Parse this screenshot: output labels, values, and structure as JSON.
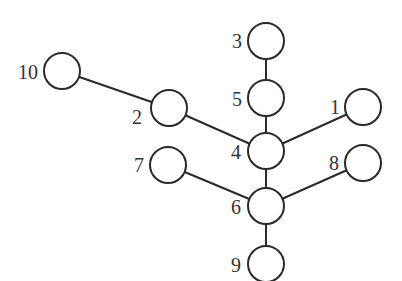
{
  "diagram": {
    "type": "tree",
    "node_radius": 18,
    "colors": {
      "stroke": "#2a2a2a",
      "fill": "#ffffff",
      "label": "#333333"
    },
    "nodes": [
      {
        "id": "1",
        "label": "1",
        "cx": 363,
        "cy": 107,
        "lx": 330,
        "ly": 114,
        "anchor": "start"
      },
      {
        "id": "2",
        "label": "2",
        "cx": 169,
        "cy": 108,
        "lx": 132,
        "ly": 124,
        "anchor": "start"
      },
      {
        "id": "3",
        "label": "3",
        "cx": 266,
        "cy": 41,
        "lx": 232,
        "ly": 48,
        "anchor": "start"
      },
      {
        "id": "4",
        "label": "4",
        "cx": 266,
        "cy": 151,
        "lx": 231,
        "ly": 159,
        "anchor": "start"
      },
      {
        "id": "5",
        "label": "5",
        "cx": 266,
        "cy": 98,
        "lx": 232,
        "ly": 106,
        "anchor": "start"
      },
      {
        "id": "6",
        "label": "6",
        "cx": 266,
        "cy": 206,
        "lx": 231,
        "ly": 214,
        "anchor": "start"
      },
      {
        "id": "7",
        "label": "7",
        "cx": 168,
        "cy": 165,
        "lx": 134,
        "ly": 172,
        "anchor": "start"
      },
      {
        "id": "8",
        "label": "8",
        "cx": 363,
        "cy": 163,
        "lx": 329,
        "ly": 170,
        "anchor": "start"
      },
      {
        "id": "9",
        "label": "9",
        "cx": 266,
        "cy": 264,
        "lx": 231,
        "ly": 272,
        "anchor": "start"
      },
      {
        "id": "10",
        "label": "10",
        "cx": 62,
        "cy": 71,
        "lx": 18,
        "ly": 79,
        "anchor": "start"
      }
    ],
    "edges": [
      [
        "3",
        "5"
      ],
      [
        "5",
        "4"
      ],
      [
        "4",
        "6"
      ],
      [
        "6",
        "9"
      ],
      [
        "10",
        "2"
      ],
      [
        "2",
        "4"
      ],
      [
        "1",
        "4"
      ],
      [
        "7",
        "6"
      ],
      [
        "8",
        "6"
      ]
    ]
  }
}
